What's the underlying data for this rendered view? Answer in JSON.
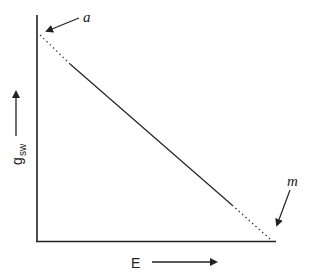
{
  "diagram": {
    "title": "",
    "x_axis": {
      "label": "E",
      "arrow": "right"
    },
    "y_axis": {
      "label": "g",
      "subscript": "sw",
      "arrow": "up"
    },
    "line": {
      "description": "Straight decreasing line from point a on the y-axis to point m on the x-axis; dotted near both ends, solid in the middle",
      "start_point": "a",
      "end_point": "m"
    },
    "annotations": [
      {
        "label": "a",
        "points_to": "intercept with y-axis (top)"
      },
      {
        "label": "m",
        "points_to": "intercept with x-axis (right)"
      }
    ],
    "colors": {
      "stroke": "#222222",
      "background": "#ffffff"
    }
  }
}
